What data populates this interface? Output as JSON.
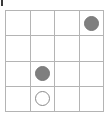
{
  "board": {
    "title": "4x4 grid board",
    "rows": 4,
    "cols": 4,
    "grid_line_color": "#b4b4b4",
    "background_color": "#ffffff",
    "filled_piece_color": "#7f7f7f",
    "open_piece_stroke_color": "#8a8a8a",
    "open_piece_fill_color": "#ffffff",
    "corner_tick_color": "#3a3a3a",
    "cells": [
      [
        {
          "state": "empty",
          "label": ""
        },
        {
          "state": "empty",
          "label": ""
        },
        {
          "state": "empty",
          "label": ""
        },
        {
          "state": "filled",
          "label": ""
        }
      ],
      [
        {
          "state": "empty",
          "label": ""
        },
        {
          "state": "empty",
          "label": ""
        },
        {
          "state": "empty",
          "label": ""
        },
        {
          "state": "empty",
          "label": ""
        }
      ],
      [
        {
          "state": "empty",
          "label": ""
        },
        {
          "state": "filled",
          "label": ""
        },
        {
          "state": "empty",
          "label": ""
        },
        {
          "state": "empty",
          "label": ""
        }
      ],
      [
        {
          "state": "empty",
          "label": ""
        },
        {
          "state": "open",
          "label": ""
        },
        {
          "state": "empty",
          "label": ""
        },
        {
          "state": "empty",
          "label": ""
        }
      ]
    ]
  }
}
